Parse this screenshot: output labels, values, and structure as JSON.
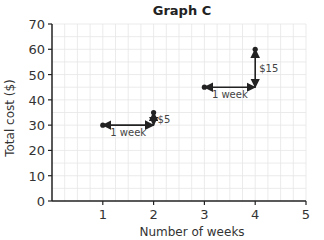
{
  "chart_data": {
    "type": "scatter",
    "title": "Graph C",
    "xlabel": "Number of weeks",
    "ylabel": "Total cost ($)",
    "xlim": [
      0,
      5
    ],
    "ylim": [
      0,
      70
    ],
    "x_ticks": [
      1,
      2,
      3,
      4,
      5
    ],
    "y_ticks": [
      0,
      10,
      20,
      30,
      40,
      50,
      60,
      70
    ],
    "grid": true,
    "minor_grid_x_step": 0.25,
    "minor_grid_y_step": 5,
    "points": [
      {
        "x": 1,
        "y": 30
      },
      {
        "x": 2,
        "y": 35
      },
      {
        "x": 3,
        "y": 45
      },
      {
        "x": 4,
        "y": 60
      }
    ],
    "annotations": [
      {
        "type": "horizontal-arrow",
        "from": [
          1,
          30
        ],
        "to": [
          2,
          30
        ],
        "label": "1 week"
      },
      {
        "type": "vertical-arrow",
        "from": [
          2,
          35
        ],
        "to": [
          2,
          30
        ],
        "label": "$5"
      },
      {
        "type": "horizontal-arrow",
        "from": [
          3,
          45
        ],
        "to": [
          4,
          45
        ],
        "label": "1 week"
      },
      {
        "type": "vertical-arrow",
        "from": [
          4,
          60
        ],
        "to": [
          4,
          45
        ],
        "label": "$15"
      }
    ],
    "colors": {
      "grid": "#e6e6e6",
      "axis": "#222222",
      "points": "#222222",
      "text": "#333333"
    }
  }
}
